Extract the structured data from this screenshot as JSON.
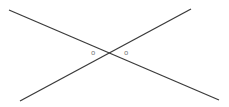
{
  "diagram": {
    "type": "intersecting-lines",
    "line_color": "#3a3a3a",
    "label_color": "#777777",
    "lines": [
      {
        "name": "line-a",
        "x1": 9,
        "y1": 10,
        "x2": 219,
        "y2": 100
      },
      {
        "name": "line-b",
        "x1": 20,
        "y1": 101,
        "x2": 191,
        "y2": 9
      }
    ],
    "intersection": {
      "x": 110,
      "y": 53
    },
    "labels": [
      {
        "text": "o",
        "x": 91,
        "y": 55
      },
      {
        "text": "o",
        "x": 124,
        "y": 55
      }
    ]
  }
}
